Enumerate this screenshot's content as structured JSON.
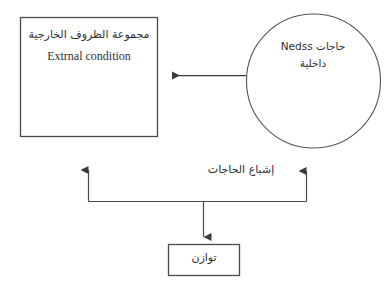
{
  "diagram": {
    "type": "flow-diagram",
    "background_color": "#ffffff",
    "stroke_color": "#4a4a4a",
    "text_color": "#2f2f2f",
    "nodes": {
      "external_conditions_box": {
        "shape": "rectangle",
        "line_ar": "مجموعة الظروف الخارجية",
        "line_en": "Extrnal condition"
      },
      "internal_needs_circle": {
        "shape": "circle",
        "line_1": "حاجات Nedss",
        "line_2": "داخلية"
      },
      "balance_box": {
        "shape": "rectangle",
        "label": "توازن"
      }
    },
    "edges": {
      "needs_to_external": {
        "label": "",
        "direction": "right-to-left",
        "arrowhead": "left"
      },
      "satisfaction_branch": {
        "label": "إشباع الحاجات",
        "direction": "bottom-split",
        "arrowheads": "up-left, up-right, down-center"
      }
    }
  }
}
